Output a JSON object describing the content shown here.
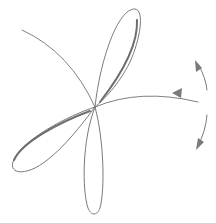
{
  "diagram": {
    "background": "#ffffff",
    "stroke_color": "#7a7a7a",
    "center": [
      95,
      107
    ],
    "petals": [
      {
        "name": "top-petal",
        "tip": [
          135,
          9
        ]
      },
      {
        "name": "left-petal",
        "tip": [
          14,
          170
        ]
      },
      {
        "name": "bottom-petal",
        "tip": [
          92,
          215
        ]
      }
    ],
    "arc": {
      "start": [
        22,
        30
      ],
      "end": [
        198,
        102
      ]
    },
    "rotation_arrows": [
      {
        "name": "rotate-up-arrow",
        "direction": "up"
      },
      {
        "name": "rotate-down-arrow",
        "direction": "down"
      }
    ]
  }
}
